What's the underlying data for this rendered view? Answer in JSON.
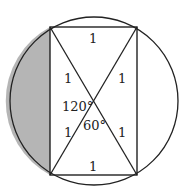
{
  "diagram": {
    "colors": {
      "stroke": "#222222",
      "shade": "#b5b5b5",
      "background": "#ffffff"
    },
    "circle": {
      "cx": 94,
      "cy": 101,
      "r": 84
    },
    "rectangle": {
      "x1": 50,
      "y1": 27,
      "x2": 137,
      "y2": 175
    },
    "labels": {
      "top": "1",
      "bottom": "1",
      "upper_left_half_diagonal": "1",
      "upper_right_half_diagonal": "1",
      "lower_left_half_diagonal": "1",
      "lower_right_half_diagonal": "1",
      "angle_obtuse": "120°",
      "angle_acute": "60°"
    }
  }
}
